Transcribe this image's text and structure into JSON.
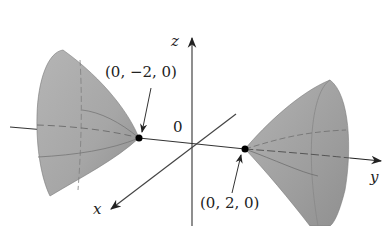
{
  "figure": {
    "type": "3D surface plot — hyperboloid of two sheets",
    "axes": {
      "x_label": "x",
      "y_label": "y",
      "z_label": "z",
      "origin_label": "0"
    },
    "points": [
      {
        "label": "(0, −2, 0)",
        "coords": [
          0,
          -2,
          0
        ]
      },
      {
        "label": "(0, 2, 0)",
        "coords": [
          0,
          2,
          0
        ]
      }
    ],
    "colors": {
      "surface_light": "#b8b8b8",
      "surface_dark": "#8e8e8e",
      "axis": "#333333",
      "text": "#222222",
      "background": "#ffffff"
    }
  }
}
